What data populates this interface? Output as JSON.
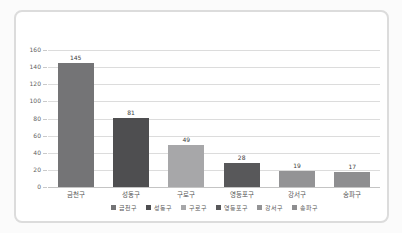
{
  "chart_data": {
    "type": "bar",
    "title": "",
    "xlabel": "",
    "ylabel": "",
    "categories": [
      "금천구",
      "성동구",
      "구로구",
      "영등포구",
      "강서구",
      "송파구"
    ],
    "values": [
      145,
      81,
      49,
      28,
      19,
      17
    ],
    "bar_colors": [
      "#747476",
      "#4e4e50",
      "#a7a7a9",
      "#58585a",
      "#939395",
      "#8e8e90"
    ],
    "ylim": [
      0,
      160
    ],
    "yticks": [
      0,
      20,
      40,
      60,
      80,
      100,
      120,
      140,
      160
    ],
    "grid": true,
    "legend_position": "bottom",
    "legend_entries": [
      "금천구",
      "성동구",
      "구로구",
      "영등포구",
      "강서구",
      "송파구"
    ]
  },
  "colors": {
    "page_bg": "#fbfbfb",
    "card_bg": "#ffffff",
    "card_border": "#dcdcdc",
    "gridline": "#dcdcdc",
    "baseline": "#c4c4c4",
    "ytick_label": "#5f5f5f",
    "data_label": "#3d3d3d",
    "xtick_label": "#555555",
    "legend_label": "#595959"
  }
}
